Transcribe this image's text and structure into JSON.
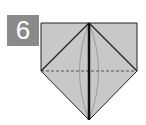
{
  "step": {
    "number": "6"
  },
  "diagram": {
    "type": "origami-step",
    "colors": {
      "paper": "#c8c8c8",
      "badge_bg": "#8a8a8a",
      "badge_text": "#ffffff",
      "line": "#222222",
      "curve": "#8f8f8f"
    }
  }
}
